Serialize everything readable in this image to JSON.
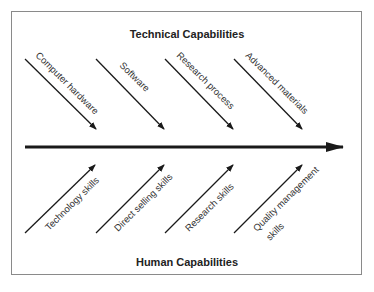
{
  "diagram": {
    "type": "fishbone",
    "top_title": "Technical Capabilities",
    "bottom_title": "Human Capabilities",
    "top_branches": [
      {
        "label": "Computer hardware"
      },
      {
        "label": "Software"
      },
      {
        "label": "Research process"
      },
      {
        "label": "Advanced materials"
      }
    ],
    "bottom_branches": [
      {
        "label": "Technology skills"
      },
      {
        "label": "Direct selling skills"
      },
      {
        "label": "Research skills"
      },
      {
        "label_line1": "Quality management",
        "label_line2": "skills"
      }
    ],
    "colors": {
      "line": "#1a1a1a",
      "frame": "#8a8a8a",
      "text": "#333333"
    }
  }
}
